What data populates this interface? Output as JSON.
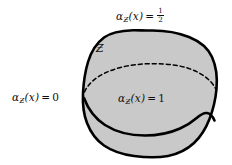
{
  "figure": {
    "background_color": "#ffffff",
    "region": {
      "name": "G",
      "label": "Ƶ",
      "fill_color": "#c9c9c9",
      "outline_color": "#000000",
      "outline_width": 2.6
    },
    "curves": {
      "dashed_arc": {
        "style": "dashed",
        "color": "#000000"
      },
      "solid_arc": {
        "style": "solid",
        "color": "#000000"
      }
    }
  },
  "labels": {
    "outside": {
      "alpha": "α",
      "subscript": "Ƶ",
      "arg": "(x)",
      "equals": "=",
      "value": "0"
    },
    "boundary": {
      "alpha": "α",
      "subscript": "Ƶ",
      "arg": "(x)",
      "equals": "=",
      "numerator": "1",
      "denominator": "2"
    },
    "inside": {
      "alpha": "α",
      "subscript": "Ƶ",
      "arg": "(x)",
      "equals": "=",
      "value": "1"
    },
    "region_name": "Ƶ"
  }
}
